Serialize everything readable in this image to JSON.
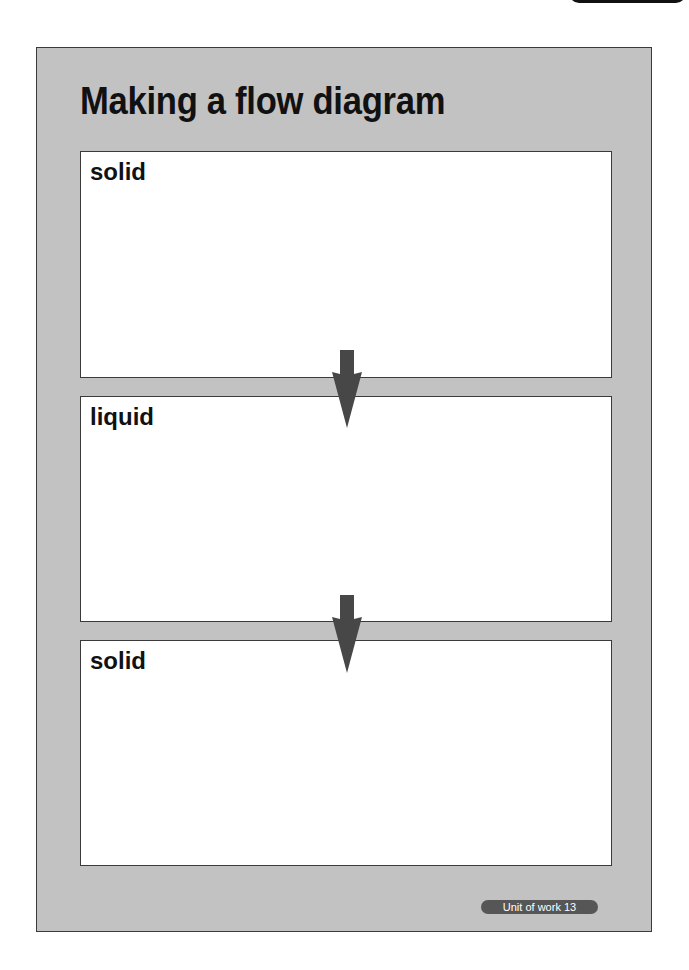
{
  "page": {
    "title": "Making a flow diagram",
    "footer_badge": "Unit of work 13"
  },
  "flow": {
    "stages": [
      {
        "label": "solid"
      },
      {
        "label": "liquid"
      },
      {
        "label": "solid"
      }
    ],
    "arrows": [
      {
        "icon": "down-arrow-icon",
        "from": "solid",
        "to": "liquid"
      },
      {
        "icon": "down-arrow-icon",
        "from": "liquid",
        "to": "solid"
      }
    ]
  },
  "colors": {
    "sheet_background": "#c2c2c2",
    "box_background": "#ffffff",
    "border": "#3a3a3a",
    "arrow": "#474747",
    "badge": "#565656",
    "text": "#111111"
  }
}
